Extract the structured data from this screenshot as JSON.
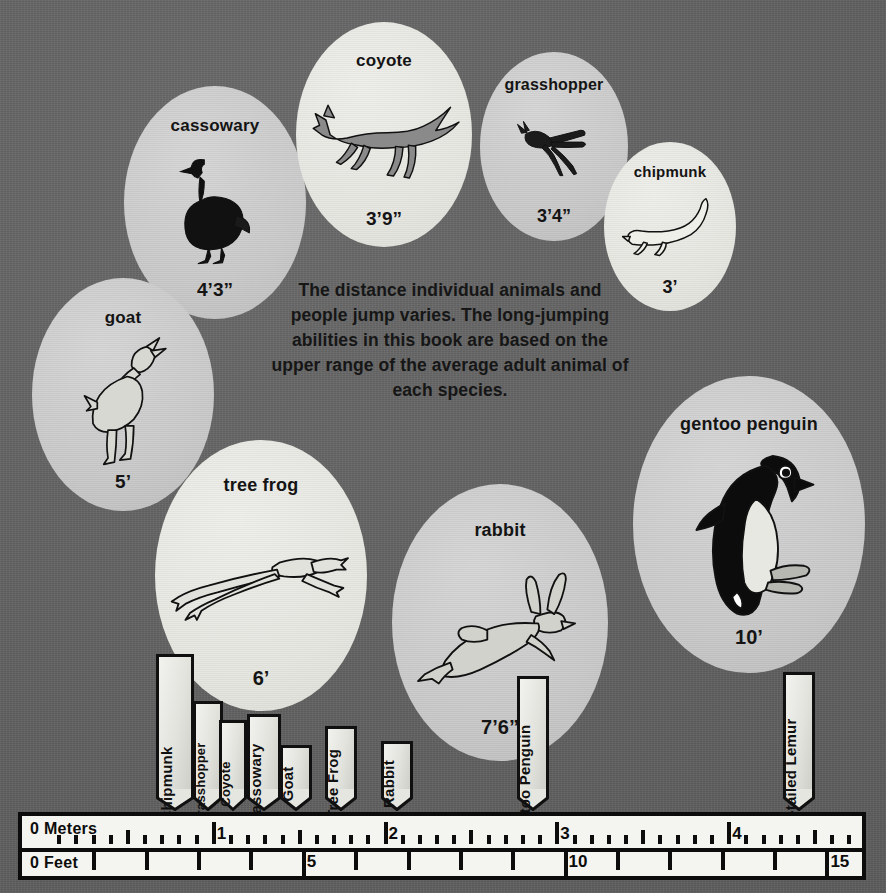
{
  "caption": {
    "text": "The distance individual animals and people jump varies. The long-jumping abilities in this book are based on the upper range of the average adult animal of each species."
  },
  "colors": {
    "background": "#646464",
    "bubble_gray": "#c9c9c9",
    "bubble_pale": "#e6e6e1",
    "ink": "#101010",
    "ruler_face": "#f4f4f0"
  },
  "bubbles": [
    {
      "id": "cassowary",
      "name": "cassowary",
      "distance": "4’3”",
      "icon": "cassowary-icon",
      "x": 124,
      "y": 86,
      "size": 182,
      "shade": "gray",
      "name_size": 17,
      "dist_size": 19
    },
    {
      "id": "coyote",
      "name": "coyote",
      "distance": "3’9”",
      "icon": "coyote-icon",
      "x": 296,
      "y": 22,
      "size": 176,
      "shade": "pale",
      "name_size": 17,
      "dist_size": 19
    },
    {
      "id": "grasshopper",
      "name": "grasshopper",
      "distance": "3’4”",
      "icon": "grasshopper-icon",
      "x": 480,
      "y": 52,
      "size": 148,
      "shade": "gray",
      "name_size": 16,
      "dist_size": 18
    },
    {
      "id": "chipmunk",
      "name": "chipmunk",
      "distance": "3’",
      "icon": "chipmunk-icon",
      "x": 604,
      "y": 142,
      "size": 132,
      "shade": "pale",
      "name_size": 15,
      "dist_size": 18
    },
    {
      "id": "goat",
      "name": "goat",
      "distance": "5’",
      "icon": "goat-icon",
      "x": 32,
      "y": 278,
      "size": 182,
      "shade": "gray",
      "name_size": 17,
      "dist_size": 19
    },
    {
      "id": "tree-frog",
      "name": "tree frog",
      "distance": "6’",
      "icon": "tree-frog-icon",
      "x": 155,
      "y": 440,
      "size": 212,
      "shade": "pale",
      "name_size": 18,
      "dist_size": 20
    },
    {
      "id": "rabbit",
      "name": "rabbit",
      "distance": "7’6”",
      "icon": "rabbit-icon",
      "x": 392,
      "y": 484,
      "size": 216,
      "shade": "gray",
      "name_size": 18,
      "dist_size": 20
    },
    {
      "id": "gentoo-penguin",
      "name": "gentoo penguin",
      "distance": "10’",
      "icon": "gentoo-penguin-icon",
      "x": 633,
      "y": 376,
      "size": 232,
      "shade": "gray",
      "name_size": 18,
      "dist_size": 20
    }
  ],
  "markers": [
    {
      "id": "chipmunk",
      "label": "Chipmunk",
      "tip_x": 175,
      "top": 654,
      "width": 38
    },
    {
      "id": "grasshopper",
      "label": "Grasshopper",
      "tip_x": 208,
      "top": 701,
      "width": 30
    },
    {
      "id": "coyote",
      "label": "Coyote",
      "tip_x": 233,
      "top": 720,
      "width": 28
    },
    {
      "id": "cassowary",
      "label": "Cassowary",
      "tip_x": 264,
      "top": 714,
      "width": 34
    },
    {
      "id": "goat",
      "label": "Goat",
      "tip_x": 296,
      "top": 745,
      "width": 32
    },
    {
      "id": "tree-frog",
      "label": "Tree Frog",
      "tip_x": 341,
      "top": 726,
      "width": 32
    },
    {
      "id": "rabbit",
      "label": "Rabbit",
      "tip_x": 397,
      "top": 741,
      "width": 32
    },
    {
      "id": "gentoo-penguin",
      "label": "Gentoo Penguin",
      "tip_x": 533,
      "top": 676,
      "width": 32
    },
    {
      "id": "ring-tailed-lemur",
      "label": "Ring-tailed Lemur",
      "tip_x": 799,
      "top": 672,
      "width": 32
    }
  ],
  "ruler": {
    "meters_label": "0 Meters",
    "feet_label": "0 Feet",
    "meter_numbers": [
      "1",
      "2",
      "3",
      "4"
    ],
    "feet_numbers": [
      "5",
      "10",
      "15"
    ],
    "meters_max": 4.75,
    "feet_max": 15.6,
    "meter_minor_step": 0.1,
    "foot_step": 1
  },
  "chart_data": {
    "type": "bar",
    "xlabel": "Distance",
    "units": [
      "feet",
      "meters"
    ],
    "categories": [
      "Chipmunk",
      "Grasshopper",
      "Coyote",
      "Cassowary",
      "Goat",
      "Tree Frog",
      "Rabbit",
      "Gentoo Penguin",
      "Ring-tailed Lemur"
    ],
    "values_feet": [
      3,
      3.33,
      3.75,
      4.25,
      5,
      6,
      7.5,
      10,
      15
    ],
    "labels": [
      "3’",
      "3’4”",
      "3’9”",
      "4’3”",
      "5’",
      "6’",
      "7’6”",
      "10’",
      null
    ],
    "axis_meters_ticks": [
      0,
      1,
      2,
      3,
      4
    ],
    "axis_feet_ticks": [
      0,
      5,
      10,
      15
    ],
    "grid": false,
    "legend": "none"
  }
}
